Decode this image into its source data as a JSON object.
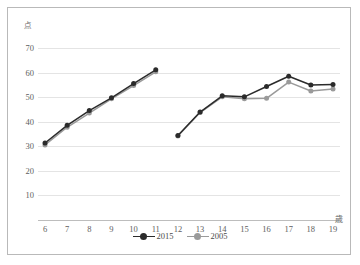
{
  "chart_data": {
    "type": "line",
    "title": "",
    "xlabel": "歳",
    "ylabel": "点",
    "ylim": [
      0,
      75
    ],
    "yticks": [
      10,
      20,
      30,
      40,
      50,
      60,
      70
    ],
    "grid": true,
    "legend_position": "bottom-center",
    "x": [
      6,
      7,
      8,
      9,
      10,
      11,
      12,
      13,
      14,
      15,
      16,
      17,
      18,
      19
    ],
    "categories": [
      "6",
      "7",
      "8",
      "9",
      "10",
      "11",
      "12",
      "13",
      "14",
      "15",
      "16",
      "17",
      "18",
      "19"
    ],
    "segment_break_after": 11,
    "series": [
      {
        "name": "2015",
        "color": "#2b2b2b",
        "marker": "circle",
        "values": [
          31.4,
          38.6,
          44.6,
          49.8,
          55.6,
          61.2,
          34.4,
          44.0,
          50.6,
          50.2,
          54.4,
          58.6,
          55.0,
          55.2
        ]
      },
      {
        "name": "2005",
        "color": "#9a9a9a",
        "marker": "circle",
        "values": [
          30.6,
          37.8,
          43.6,
          49.4,
          54.8,
          60.4,
          34.2,
          43.8,
          50.2,
          49.4,
          49.6,
          56.2,
          52.6,
          53.4
        ]
      }
    ],
    "annotations": []
  },
  "legend": {
    "entries": [
      {
        "label": "2015"
      },
      {
        "label": "2005"
      }
    ]
  },
  "axes": {
    "y_unit_label": "点",
    "x_unit_label": "歳"
  },
  "colors": {
    "series_2015": "#2b2b2b",
    "series_2005": "#9a9a9a",
    "gridline": "#e4e4e4",
    "frame": "#b9b9b9",
    "tick_text": "#5e5e5e"
  }
}
